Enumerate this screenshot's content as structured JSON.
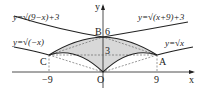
{
  "figure": {
    "axis_labels": {
      "x": "x",
      "y": "y"
    },
    "origin_label": "O",
    "tick_labels": {
      "x_neg": "−9",
      "x_pos": "9",
      "y_mid": "3",
      "y_top": "6"
    },
    "points": {
      "A": "A",
      "B": "B",
      "C": "C"
    },
    "equations": {
      "upper_left": "y=√(9−x)+3",
      "upper_right": "y=√(x+9)+3",
      "lower_left": "y=√(−x)",
      "lower_right": "y=√x"
    },
    "colors": {
      "shade": "#d8d8d8",
      "curve": "#222222",
      "dashed": "#555555"
    }
  }
}
